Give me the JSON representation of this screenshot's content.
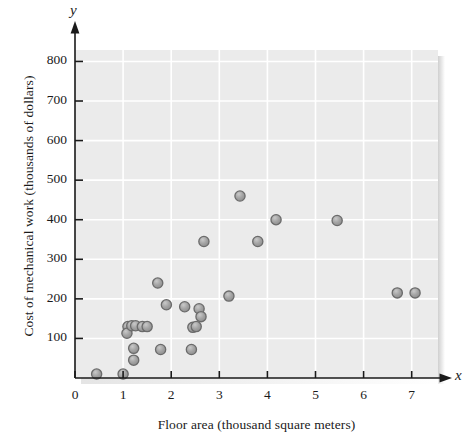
{
  "chart_data": {
    "type": "scatter",
    "title": "",
    "xlabel": "Floor area (thousand square meters)",
    "ylabel": "Cost of mechanical work (thousands of dollars)",
    "x_axis_letter": "x",
    "y_axis_letter": "y",
    "xlim": [
      0,
      7.55
    ],
    "ylim": [
      0,
      870
    ],
    "xticks": [
      0,
      1,
      2,
      3,
      4,
      5,
      6,
      7
    ],
    "yticks": [
      100,
      200,
      300,
      400,
      500,
      600,
      700,
      800
    ],
    "xtick_labels": [
      "0",
      "1",
      "2",
      "3",
      "4",
      "5",
      "6",
      "7"
    ],
    "ytick_labels": [
      "100",
      "200",
      "300",
      "400",
      "500",
      "600",
      "700",
      "800"
    ],
    "grid": true,
    "legend": null,
    "plot_bgcolor": "#ebebeb",
    "grid_color": "#ffffff",
    "marker_fill": "#9a9a9a",
    "marker_edge": "#6b6b6b",
    "axis_color": "#1a1a1a",
    "marker_size": 9,
    "n_points": 27,
    "points": [
      {
        "x": 0.45,
        "y": 10
      },
      {
        "x": 1.0,
        "y": 10
      },
      {
        "x": 1.1,
        "y": 130
      },
      {
        "x": 1.08,
        "y": 113
      },
      {
        "x": 1.18,
        "y": 132
      },
      {
        "x": 1.26,
        "y": 132
      },
      {
        "x": 1.4,
        "y": 130
      },
      {
        "x": 1.5,
        "y": 130
      },
      {
        "x": 1.22,
        "y": 75
      },
      {
        "x": 1.22,
        "y": 45
      },
      {
        "x": 1.72,
        "y": 240
      },
      {
        "x": 1.9,
        "y": 185
      },
      {
        "x": 1.78,
        "y": 72
      },
      {
        "x": 2.28,
        "y": 180
      },
      {
        "x": 2.45,
        "y": 128
      },
      {
        "x": 2.42,
        "y": 72
      },
      {
        "x": 2.58,
        "y": 175
      },
      {
        "x": 2.62,
        "y": 155
      },
      {
        "x": 2.68,
        "y": 345
      },
      {
        "x": 3.2,
        "y": 207
      },
      {
        "x": 3.43,
        "y": 460
      },
      {
        "x": 3.8,
        "y": 345
      },
      {
        "x": 4.18,
        "y": 400
      },
      {
        "x": 5.45,
        "y": 398
      },
      {
        "x": 6.7,
        "y": 215
      },
      {
        "x": 7.07,
        "y": 215
      },
      {
        "x": 2.52,
        "y": 130
      }
    ]
  }
}
